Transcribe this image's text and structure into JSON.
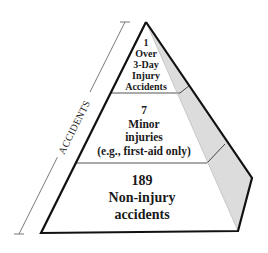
{
  "diagram": {
    "type": "accident-pyramid",
    "axis_label": "ACCIDENTS",
    "levels": [
      {
        "count": "1",
        "label_lines": [
          "Over",
          "3-Day",
          "Injury",
          "Accidents"
        ]
      },
      {
        "count": "7",
        "label_lines": [
          "Minor",
          "injuries",
          "(e.g., first-aid only)"
        ]
      },
      {
        "count": "189",
        "label_lines": [
          "Non-injury",
          "accidents"
        ]
      }
    ],
    "colors": {
      "outline": "#111111",
      "face": "#ffffff",
      "shaded_side": "#d9d9d9",
      "divider": "#555555",
      "axis": "#444444"
    }
  }
}
